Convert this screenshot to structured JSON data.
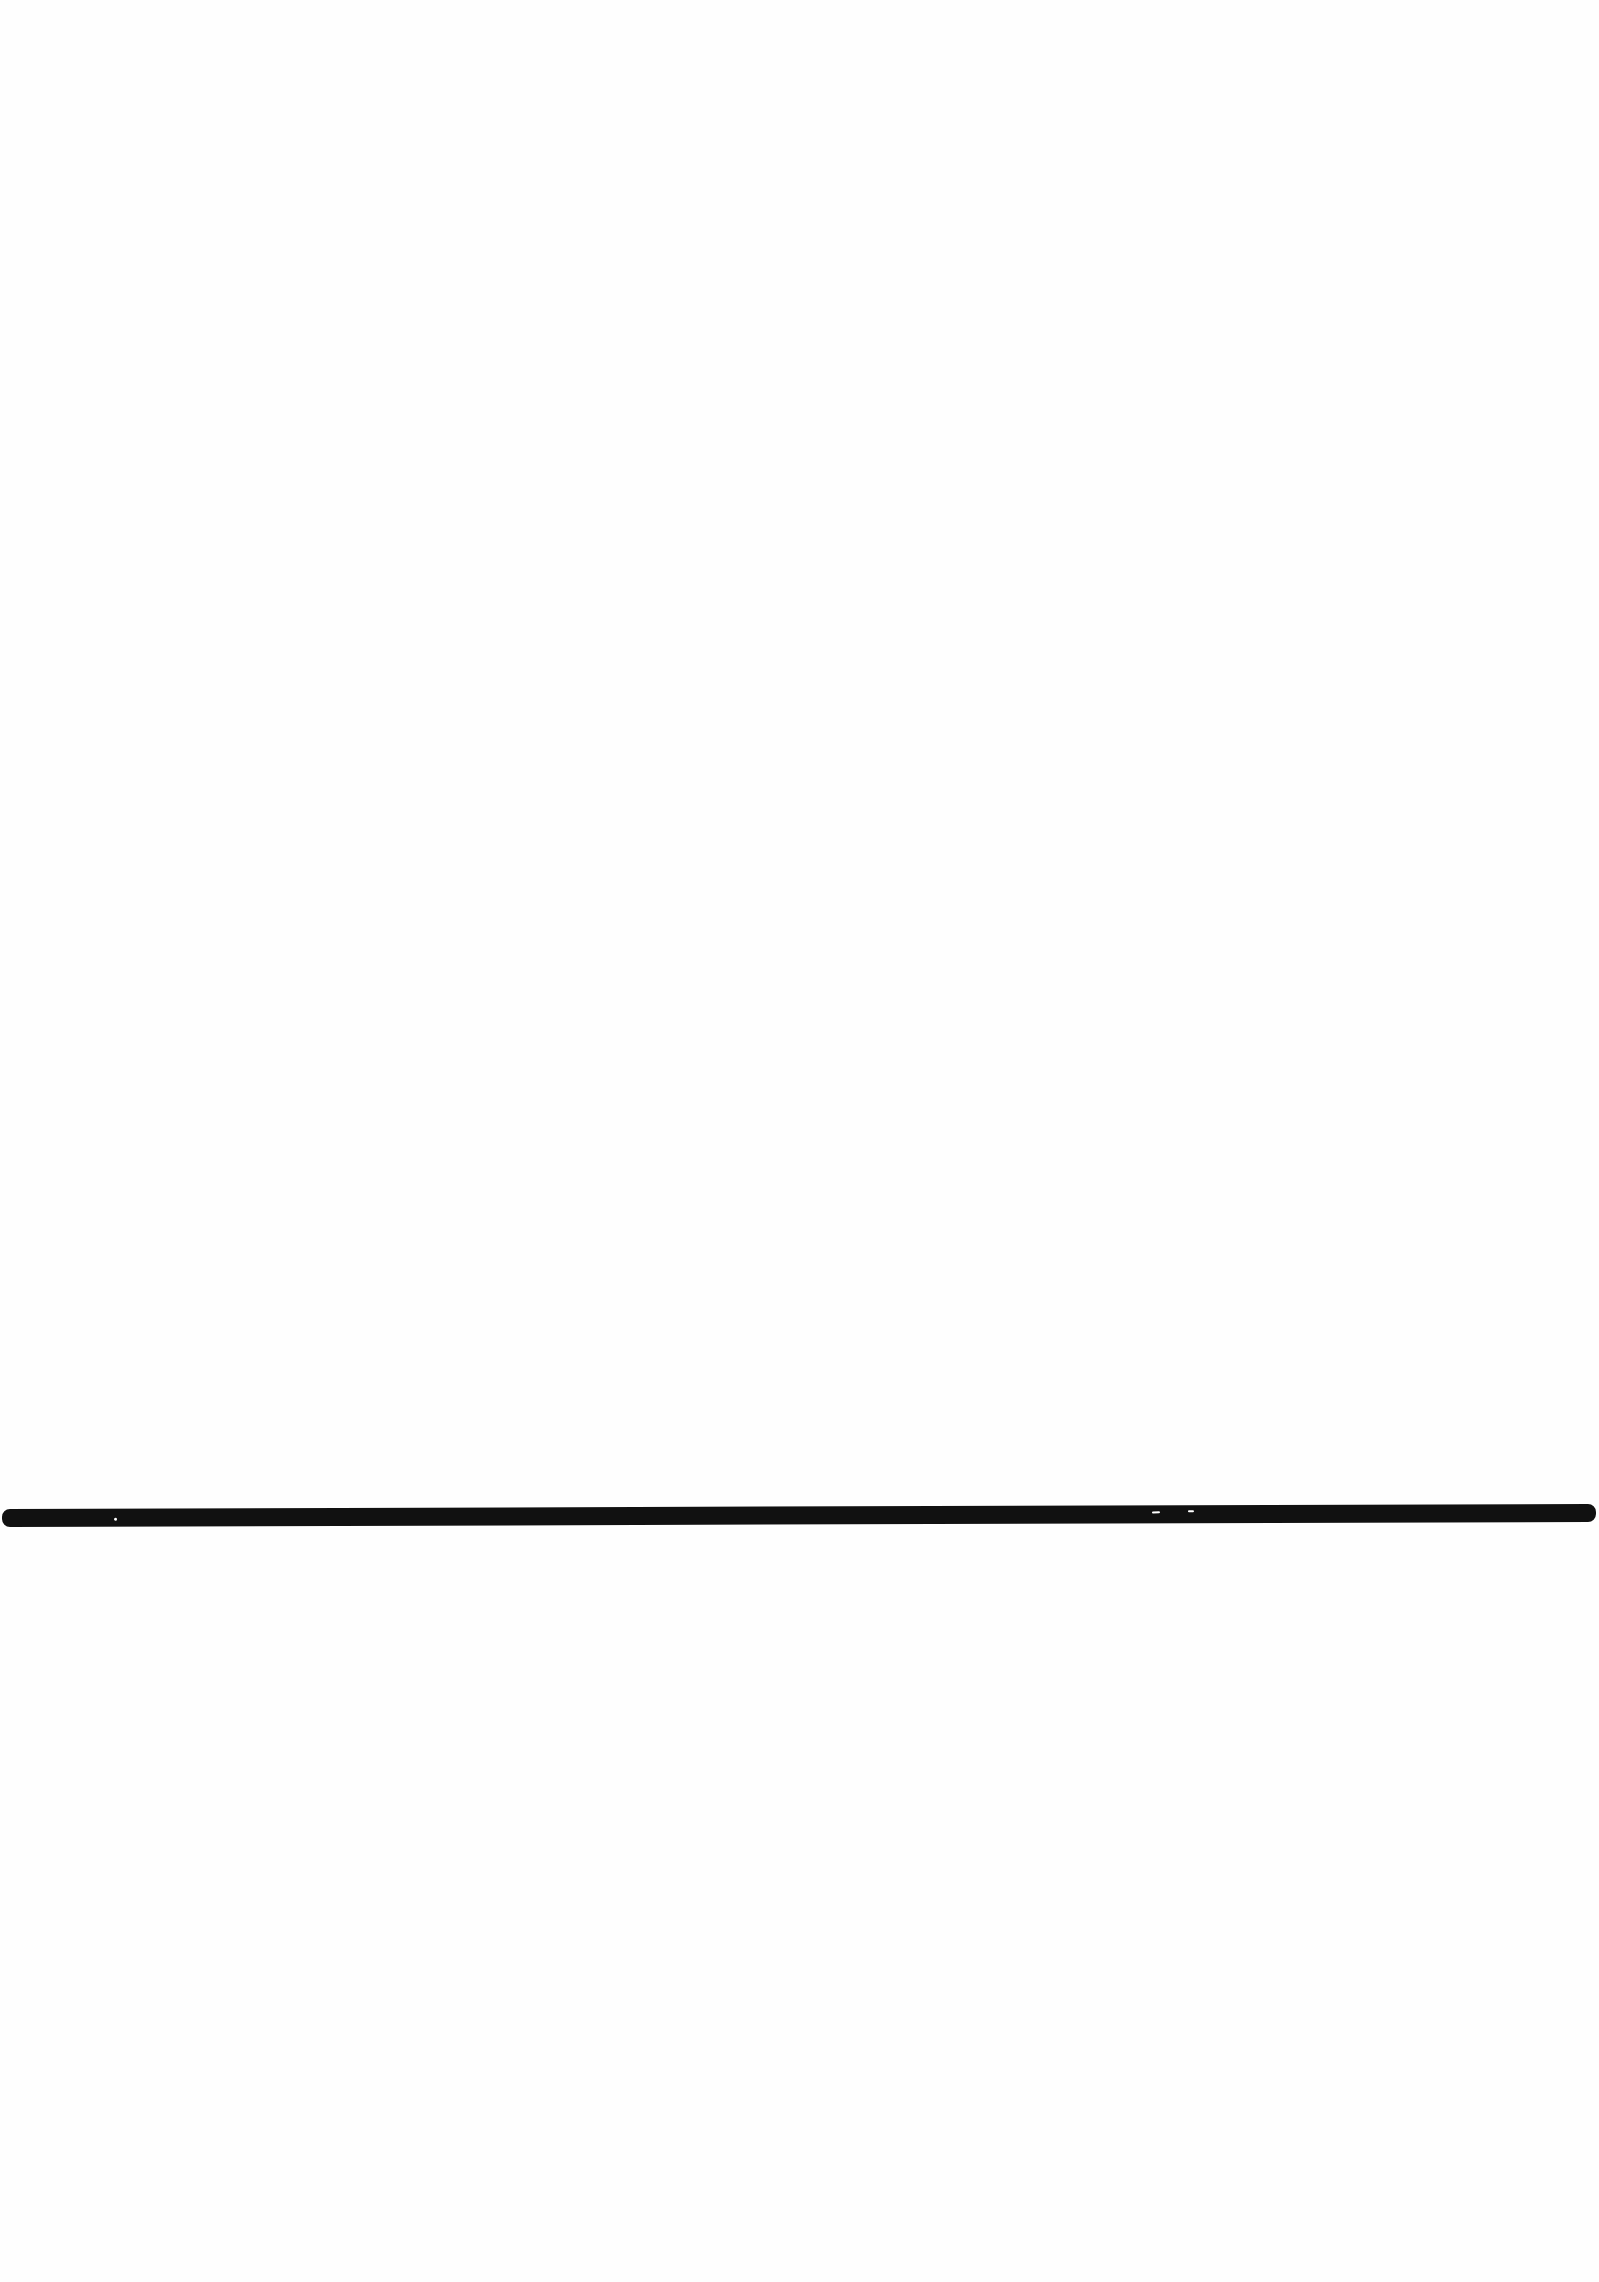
{
  "page": {
    "background_color": "#ffffff",
    "text": ""
  },
  "rule": {
    "color": "#111111",
    "orientation": "horizontal",
    "thickness_px": 18
  }
}
